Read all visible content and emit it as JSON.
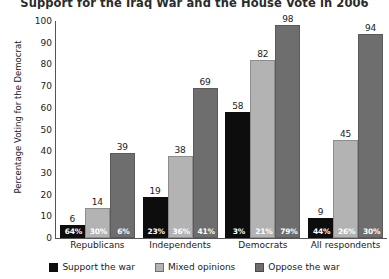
{
  "chart_data": {
    "type": "bar",
    "title": "Support for the Iraq War and the House Vote in 2006",
    "xlabel": "",
    "ylabel": "Percentage Voting for the Democrat",
    "ylim": [
      0,
      100
    ],
    "yticks": [
      0,
      10,
      20,
      30,
      40,
      50,
      60,
      70,
      80,
      90,
      100
    ],
    "grid": false,
    "legend_position": "bottom",
    "categories": [
      "Republicans",
      "Independents",
      "Democrats",
      "All respondents"
    ],
    "series": [
      {
        "name": "Support the war",
        "color": "#0d0d0d",
        "values": [
          6,
          19,
          58,
          9
        ],
        "share_labels": [
          "64%",
          "23%",
          "3%",
          "44%"
        ]
      },
      {
        "name": "Mixed opinions",
        "color": "#b3b3b3",
        "values": [
          14,
          38,
          82,
          45
        ],
        "share_labels": [
          "30%",
          "36%",
          "21%",
          "26%"
        ]
      },
      {
        "name": "Oppose the war",
        "color": "#6e6e6e",
        "values": [
          39,
          69,
          98,
          94
        ],
        "share_labels": [
          "6%",
          "41%",
          "79%",
          "30%"
        ]
      }
    ]
  }
}
